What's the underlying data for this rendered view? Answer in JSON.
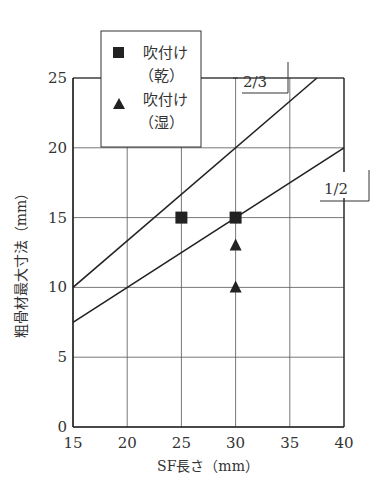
{
  "chart_data": {
    "type": "scatter",
    "title": "",
    "xlabel": "SF長さ（mm）",
    "ylabel": "粗骨材最大寸法（mm）",
    "xlim": [
      15,
      40
    ],
    "ylim": [
      0,
      25
    ],
    "xticks": [
      15,
      20,
      25,
      30,
      35,
      40
    ],
    "yticks": [
      0,
      5,
      10,
      15,
      20,
      25
    ],
    "grid": true,
    "series": [
      {
        "name": "吹付け（乾）",
        "marker": "square",
        "points": [
          [
            25,
            15
          ],
          [
            30,
            15
          ]
        ]
      },
      {
        "name": "吹付け（湿）",
        "marker": "triangle",
        "points": [
          [
            30,
            13
          ],
          [
            30,
            10
          ]
        ]
      }
    ],
    "reference_lines": [
      {
        "label": "2/3",
        "slope": 0.6667,
        "points": [
          [
            15,
            10
          ],
          [
            37.5,
            25
          ]
        ]
      },
      {
        "label": "1/2",
        "slope": 0.5,
        "points": [
          [
            15,
            7.5
          ],
          [
            40,
            20
          ]
        ]
      }
    ],
    "legend": {
      "position": "top-inside",
      "entries": [
        {
          "marker": "square",
          "line1": "吹付け",
          "line2": "（乾）"
        },
        {
          "marker": "triangle",
          "line1": "吹付け",
          "line2": "（湿）"
        }
      ]
    }
  }
}
